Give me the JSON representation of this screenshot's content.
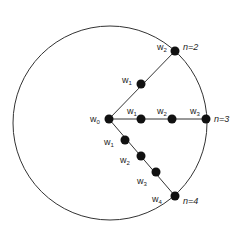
{
  "diagram": {
    "colors": {
      "stroke": "#333333",
      "dot": "#111111",
      "background": "#ffffff"
    },
    "circle": {
      "cx": 110,
      "cy": 123,
      "r": 97
    },
    "center": {
      "x": 109,
      "y": 119,
      "label": "w",
      "sub": "0"
    },
    "arms": [
      {
        "name": "n=2",
        "end_label": "n=2",
        "nodes": [
          {
            "x": 141,
            "y": 84,
            "label": "w",
            "sub": "1"
          },
          {
            "x": 175,
            "y": 51,
            "label": "w",
            "sub": "2"
          }
        ]
      },
      {
        "name": "n=3",
        "end_label": "n=3",
        "nodes": [
          {
            "x": 141,
            "y": 119,
            "label": "w",
            "sub": "1"
          },
          {
            "x": 172,
            "y": 119,
            "label": "w",
            "sub": "2"
          },
          {
            "x": 206,
            "y": 119,
            "label": "w",
            "sub": "3"
          }
        ]
      },
      {
        "name": "n=4",
        "end_label": "n=4",
        "nodes": [
          {
            "x": 125,
            "y": 140,
            "label": "w",
            "sub": "1"
          },
          {
            "x": 141,
            "y": 156,
            "label": "w",
            "sub": "2"
          },
          {
            "x": 156,
            "y": 172,
            "label": "w",
            "sub": "3"
          },
          {
            "x": 175,
            "y": 196,
            "label": "w",
            "sub": "4"
          }
        ]
      }
    ]
  }
}
